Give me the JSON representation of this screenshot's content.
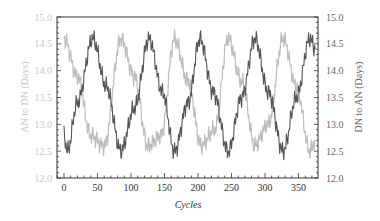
{
  "chart_data": {
    "type": "line",
    "title": "",
    "xlabel": "Cycles",
    "ylabel_left": "AN to DN (Days)",
    "ylabel_right": "DN to AN (Days)",
    "xlim": [
      -10,
      380
    ],
    "ylim_left": [
      12.0,
      15.0
    ],
    "ylim_right": [
      12.0,
      15.0
    ],
    "x_ticks": [
      0,
      50,
      100,
      150,
      200,
      250,
      300,
      350
    ],
    "y_ticks_left": [
      "12.0",
      "12.5",
      "13.0",
      "13.5",
      "14.0",
      "14.5",
      "15.0"
    ],
    "y_ticks_right": [
      "12.0",
      "12.5",
      "13.0",
      "13.5",
      "14.0",
      "14.5",
      "15.0"
    ],
    "grid": false,
    "legend": "none",
    "series": [
      {
        "name": "AN to DN (Days)",
        "axis": "left",
        "color": "#bdbdbd",
        "description": "oscillation ~12.4–14.7 days, period ~81 cycles, peaks near cycles 0, 85, 165, 245, 327",
        "x": [
          0,
          20,
          40,
          60,
          85,
          105,
          125,
          145,
          165,
          185,
          205,
          225,
          245,
          265,
          285,
          305,
          327,
          347,
          367,
          375
        ],
        "values": [
          14.6,
          13.9,
          12.8,
          12.6,
          14.6,
          13.9,
          12.6,
          12.8,
          14.6,
          13.8,
          12.6,
          12.9,
          14.6,
          13.8,
          12.6,
          13.0,
          14.6,
          13.7,
          12.5,
          12.7
        ]
      },
      {
        "name": "DN to AN (Days)",
        "axis": "right",
        "color": "#555555",
        "description": "oscillation ~12.4–14.7 days in anti-phase to AN to DN, peaks near cycles 43, 127, 203, 285, 367",
        "x": [
          0,
          5,
          20,
          43,
          63,
          85,
          105,
          127,
          147,
          165,
          185,
          203,
          223,
          245,
          265,
          285,
          305,
          327,
          347,
          367,
          375
        ],
        "values": [
          12.8,
          12.5,
          13.4,
          14.6,
          13.7,
          12.5,
          13.3,
          14.6,
          13.6,
          12.5,
          13.4,
          14.6,
          13.6,
          12.5,
          13.5,
          14.6,
          13.6,
          12.5,
          13.5,
          14.6,
          14.4
        ]
      }
    ],
    "cycle_period_estimate": 81
  },
  "plot": {
    "frame": {
      "left": 57,
      "top": 17,
      "right": 318,
      "bottom": 178
    },
    "x_px_per_unit": 0.67,
    "x_zero_px": 64
  }
}
